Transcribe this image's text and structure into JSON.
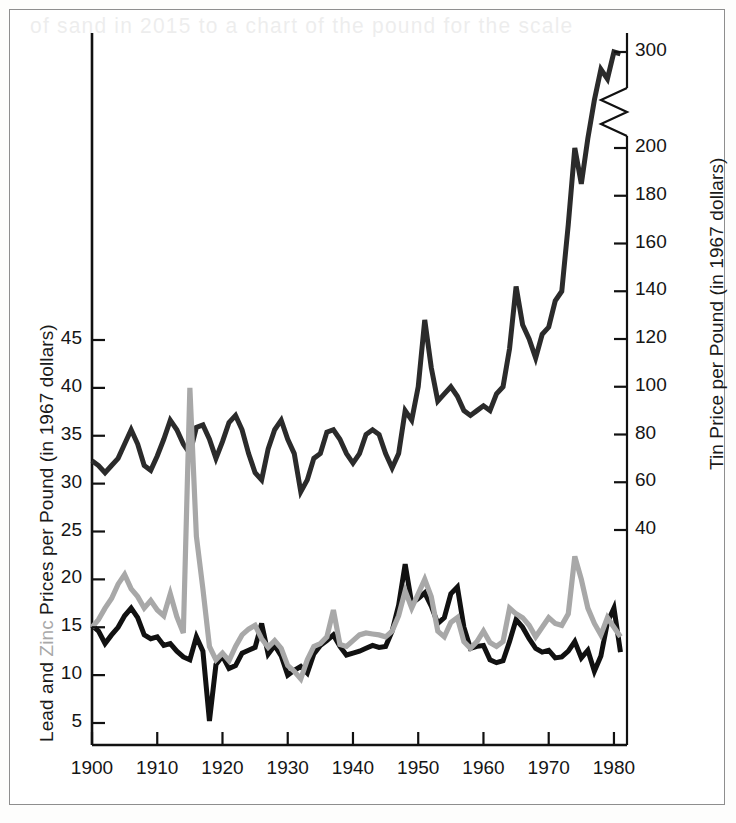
{
  "figure": {
    "ghost_text": "of sand in 2015 to a chart of the pound for the scale",
    "background": "#ffffff",
    "frame_color": "#8e8e8e"
  },
  "colors": {
    "lead": "#111111",
    "zinc": "#a8a8a8",
    "tin": "#2b2b2b",
    "axis": "#111111",
    "text": "#151515"
  },
  "chart_data": {
    "type": "line",
    "title": "",
    "xlabel": "",
    "grid": false,
    "legend": "none (series named inside axis titles)",
    "axes": {
      "x": {
        "label": "",
        "ticks": [
          1900,
          1910,
          1920,
          1930,
          1940,
          1950,
          1960,
          1970,
          1980
        ],
        "tick_labels": [
          "1900",
          "1910",
          "1920",
          "1930",
          "1940",
          "1950",
          "1960",
          "1970",
          "1980"
        ],
        "range": [
          1900,
          1982
        ]
      },
      "y_left": {
        "label": "Lead and Zinc Prices per Pound (in 1967 dollars)",
        "label_parts": [
          {
            "text": "Lead and ",
            "color": "#151515"
          },
          {
            "text": "Zinc",
            "color": "#a8a8a8"
          },
          {
            "text": " Prices per Pound (in 1967 dollars)",
            "color": "#151515"
          }
        ],
        "ticks": [
          5,
          10,
          15,
          20,
          25,
          30,
          35,
          40,
          45
        ],
        "tick_labels": [
          "5",
          "10",
          "15",
          "20",
          "25",
          "30",
          "35",
          "40",
          "45"
        ],
        "range": [
          0,
          50
        ],
        "units": "cents per pound"
      },
      "y_right": {
        "label": "Tin Price per Pound (in 1967 dollars)",
        "ticks": [
          40,
          60,
          80,
          100,
          120,
          140,
          160,
          180,
          200,
          300
        ],
        "tick_labels": [
          "40",
          "60",
          "80",
          "100",
          "120",
          "140",
          "160",
          "180",
          "200",
          "300"
        ],
        "range": [
          0,
          300
        ],
        "axis_break": {
          "between": [
            200,
            300
          ],
          "style": "zigzag"
        },
        "units": "cents per pound"
      }
    },
    "series": [
      {
        "name": "Tin",
        "color": "#2b2b2b",
        "axis": "y_right",
        "x": [
          1900,
          1901,
          1902,
          1903,
          1904,
          1905,
          1906,
          1907,
          1908,
          1909,
          1910,
          1911,
          1912,
          1913,
          1914,
          1915,
          1916,
          1917,
          1918,
          1919,
          1920,
          1921,
          1922,
          1923,
          1924,
          1925,
          1926,
          1927,
          1928,
          1929,
          1930,
          1931,
          1932,
          1933,
          1934,
          1935,
          1936,
          1937,
          1938,
          1939,
          1940,
          1941,
          1942,
          1943,
          1944,
          1945,
          1946,
          1947,
          1948,
          1949,
          1950,
          1951,
          1952,
          1953,
          1954,
          1955,
          1956,
          1957,
          1958,
          1959,
          1960,
          1961,
          1962,
          1963,
          1964,
          1965,
          1966,
          1967,
          1968,
          1969,
          1970,
          1971,
          1972,
          1973,
          1974,
          1975,
          1976,
          1977,
          1978,
          1979,
          1980,
          1981
        ],
        "values": [
          69,
          67,
          64,
          67,
          70,
          76,
          82,
          76,
          67,
          65,
          71,
          78,
          86,
          82,
          76,
          72,
          83,
          84,
          78,
          70,
          77,
          85,
          88,
          82,
          72,
          64,
          61,
          74,
          82,
          86,
          78,
          72,
          56,
          61,
          70,
          72,
          81,
          82,
          78,
          72,
          68,
          72,
          80,
          82,
          80,
          72,
          66,
          72,
          90,
          86,
          100,
          128,
          108,
          94,
          97,
          100,
          96,
          90,
          88,
          90,
          92,
          90,
          97,
          100,
          116,
          142,
          126,
          120,
          112,
          122,
          125,
          136,
          140,
          168,
          200,
          185,
          210,
          250,
          282,
          272,
          300,
          298
        ]
      },
      {
        "name": "Lead",
        "color": "#111111",
        "axis": "y_left",
        "x": [
          1900,
          1901,
          1902,
          1903,
          1904,
          1905,
          1906,
          1907,
          1908,
          1909,
          1910,
          1911,
          1912,
          1913,
          1914,
          1915,
          1916,
          1917,
          1918,
          1919,
          1920,
          1921,
          1922,
          1923,
          1924,
          1925,
          1926,
          1927,
          1928,
          1929,
          1930,
          1931,
          1932,
          1933,
          1934,
          1935,
          1936,
          1937,
          1938,
          1939,
          1940,
          1941,
          1942,
          1943,
          1944,
          1945,
          1946,
          1947,
          1948,
          1949,
          1950,
          1951,
          1952,
          1953,
          1954,
          1955,
          1956,
          1957,
          1958,
          1959,
          1960,
          1961,
          1962,
          1963,
          1964,
          1965,
          1966,
          1967,
          1968,
          1969,
          1970,
          1971,
          1972,
          1973,
          1974,
          1975,
          1976,
          1977,
          1978,
          1979,
          1980,
          1981
        ],
        "values": [
          15.2,
          14.6,
          13.3,
          14.2,
          15.0,
          16.2,
          17.0,
          16.0,
          14.2,
          13.8,
          14.0,
          13.1,
          13.3,
          12.5,
          11.9,
          11.6,
          14.0,
          12.5,
          5.2,
          11.1,
          12.0,
          10.7,
          11.0,
          12.3,
          12.6,
          12.9,
          15.4,
          12.2,
          13.1,
          12.0,
          10.0,
          10.5,
          10.9,
          10.2,
          12.2,
          13.1,
          13.6,
          14.2,
          13.0,
          12.1,
          12.3,
          12.5,
          12.8,
          13.1,
          12.9,
          13.0,
          14.6,
          17.3,
          21.6,
          17.5,
          18.0,
          18.6,
          17.2,
          15.4,
          16.0,
          18.5,
          19.2,
          15.0,
          12.8,
          13.0,
          13.1,
          11.6,
          11.3,
          11.5,
          13.5,
          15.8,
          15.0,
          13.8,
          12.8,
          12.4,
          12.6,
          11.8,
          11.9,
          12.5,
          13.5,
          11.8,
          12.6,
          10.4,
          12.0,
          15.5,
          17.0,
          12.4
        ]
      },
      {
        "name": "Zinc",
        "color": "#a8a8a8",
        "axis": "y_left",
        "x": [
          1900,
          1901,
          1902,
          1903,
          1904,
          1905,
          1906,
          1907,
          1908,
          1909,
          1910,
          1911,
          1912,
          1913,
          1914,
          1915,
          1916,
          1917,
          1918,
          1919,
          1920,
          1921,
          1922,
          1923,
          1924,
          1925,
          1926,
          1927,
          1928,
          1929,
          1930,
          1931,
          1932,
          1933,
          1934,
          1935,
          1936,
          1937,
          1938,
          1939,
          1940,
          1941,
          1942,
          1943,
          1944,
          1945,
          1946,
          1947,
          1948,
          1949,
          1950,
          1951,
          1952,
          1953,
          1954,
          1955,
          1956,
          1957,
          1958,
          1959,
          1960,
          1961,
          1962,
          1963,
          1964,
          1965,
          1966,
          1967,
          1968,
          1969,
          1970,
          1971,
          1972,
          1973,
          1974,
          1975,
          1976,
          1977,
          1978,
          1979,
          1980,
          1981
        ],
        "values": [
          15.0,
          15.8,
          17.0,
          18.0,
          19.5,
          20.5,
          19.0,
          18.2,
          17.0,
          17.8,
          16.8,
          16.2,
          18.5,
          16.1,
          14.4,
          40.0,
          24.5,
          19.0,
          13.0,
          11.6,
          12.3,
          11.5,
          13.0,
          14.2,
          14.8,
          15.2,
          13.8,
          12.9,
          13.6,
          12.8,
          11.0,
          10.4,
          9.6,
          11.6,
          13.0,
          13.3,
          14.0,
          16.8,
          13.2,
          13.0,
          13.6,
          14.2,
          14.4,
          14.3,
          14.2,
          14.0,
          14.6,
          16.2,
          18.8,
          17.0,
          18.5,
          20.0,
          18.2,
          14.6,
          14.0,
          15.5,
          16.0,
          13.5,
          12.8,
          13.5,
          14.6,
          13.4,
          13.0,
          13.5,
          17.0,
          16.4,
          16.0,
          15.2,
          14.0,
          15.0,
          16.0,
          15.4,
          15.2,
          16.4,
          22.4,
          20.0,
          17.0,
          15.4,
          14.2,
          16.0,
          15.0,
          14.0
        ]
      }
    ]
  },
  "notes": {
    "lead_label": "Lead",
    "zinc_label": "Zinc",
    "tin_label": "Tin"
  }
}
